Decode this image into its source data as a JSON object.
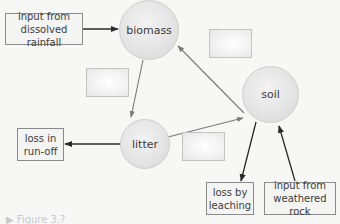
{
  "diagram": {
    "type": "nutrient-cycle-flow",
    "nodes": {
      "biomass": "biomass",
      "litter": "litter",
      "soil": "soil"
    },
    "labels": {
      "rainfall_input": "input from dissolved rainfall",
      "runoff_loss": "loss in run-off",
      "leaching_loss": "loss by leaching",
      "weathering_input": "input from weathered rock"
    },
    "blank_boxes": 3,
    "arrows": [
      {
        "from": "input from dissolved rainfall",
        "to": "biomass"
      },
      {
        "from": "biomass",
        "to": "litter"
      },
      {
        "from": "litter",
        "to": "soil"
      },
      {
        "from": "soil",
        "to": "biomass"
      },
      {
        "from": "litter",
        "to": "loss in run-off"
      },
      {
        "from": "soil",
        "to": "loss by leaching"
      },
      {
        "from": "input from weathered rock",
        "to": "soil"
      }
    ],
    "colors": {
      "arrow_internal": "#7a7a7a",
      "arrow_external": "#2a2a2a",
      "node_fill": "#e3e3e3",
      "background": "#f7f7f6"
    }
  },
  "caption": {
    "text": "▶ Figure 3.?"
  }
}
